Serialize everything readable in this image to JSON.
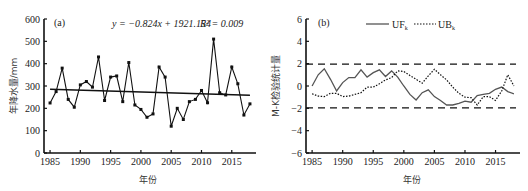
{
  "chart_data": [
    {
      "type": "line",
      "panel_label": "(a)",
      "title": "",
      "xlabel": "年份",
      "ylabel": "年降水量/mm",
      "xlim": [
        1984,
        2019
      ],
      "ylim": [
        0,
        600
      ],
      "xticks": [
        1985,
        1990,
        1995,
        2000,
        2005,
        2010,
        2015
      ],
      "yticks": [
        0,
        100,
        200,
        300,
        400,
        500,
        600
      ],
      "grid": false,
      "annotation": "y = −0.824x + 1921.154",
      "r2_label": "R² = 0.009",
      "x": [
        1985,
        1986,
        1987,
        1988,
        1989,
        1990,
        1991,
        1992,
        1993,
        1994,
        1995,
        1996,
        1997,
        1998,
        1999,
        2000,
        2001,
        2002,
        2003,
        2004,
        2005,
        2006,
        2007,
        2008,
        2009,
        2010,
        2011,
        2012,
        2013,
        2014,
        2015,
        2016,
        2017,
        2018
      ],
      "series": [
        {
          "name": "annual precipitation",
          "style": "solid-with-square-markers",
          "values": [
            224,
            275,
            380,
            240,
            205,
            305,
            320,
            295,
            430,
            235,
            340,
            345,
            230,
            405,
            215,
            195,
            160,
            175,
            385,
            340,
            120,
            200,
            150,
            230,
            240,
            280,
            225,
            510,
            270,
            260,
            385,
            310,
            170,
            220
          ]
        },
        {
          "name": "linear trend",
          "style": "solid",
          "slope": -0.824,
          "intercept": 1921.154,
          "values_at_ends": {
            "1985": 285.5,
            "2018": 258.3
          }
        }
      ]
    },
    {
      "type": "line",
      "panel_label": "(b)",
      "title": "",
      "xlabel": "年份",
      "ylabel": "M-K检验统计量",
      "xlim": [
        1984,
        2019
      ],
      "ylim": [
        -6,
        6
      ],
      "xticks": [
        1985,
        1990,
        1995,
        2000,
        2005,
        2010,
        2015
      ],
      "yticks": [
        -6,
        -4,
        -2,
        0,
        2,
        4,
        6
      ],
      "grid": false,
      "legend": {
        "position": "top-center",
        "entries": [
          "UFk",
          "UBk"
        ]
      },
      "reference_lines": [
        1.96,
        -1.96
      ],
      "x": [
        1985,
        1986,
        1987,
        1988,
        1989,
        1990,
        1991,
        1992,
        1993,
        1994,
        1995,
        1996,
        1997,
        1998,
        1999,
        2000,
        2001,
        2002,
        2003,
        2004,
        2005,
        2006,
        2007,
        2008,
        2009,
        2010,
        2011,
        2012,
        2013,
        2014,
        2015,
        2016,
        2017,
        2018
      ],
      "series": [
        {
          "name": "UFk",
          "style": "solid",
          "values": [
            0.0,
            1.0,
            1.55,
            0.6,
            -0.45,
            0.3,
            0.75,
            0.75,
            1.45,
            0.8,
            1.2,
            1.45,
            0.85,
            1.35,
            0.8,
            0.0,
            -0.75,
            -1.25,
            -0.6,
            -0.35,
            -0.95,
            -1.3,
            -1.7,
            -1.7,
            -1.55,
            -1.35,
            -1.45,
            -0.85,
            -0.75,
            -0.65,
            -0.3,
            -0.1,
            -0.5,
            -0.7
          ]
        },
        {
          "name": "UBk",
          "style": "dotted",
          "values": [
            -0.7,
            -0.9,
            -0.95,
            -0.65,
            -0.65,
            -0.95,
            -0.9,
            -0.75,
            -0.6,
            -0.1,
            -0.1,
            0.2,
            0.55,
            0.75,
            1.35,
            1.3,
            0.95,
            0.6,
            0.25,
            0.9,
            1.5,
            1.0,
            0.55,
            -0.1,
            -0.65,
            -1.0,
            -1.05,
            -1.7,
            -0.95,
            -0.95,
            -1.3,
            -0.45,
            1.0,
            0.0
          ]
        }
      ]
    }
  ],
  "panels": {
    "a": {
      "label": "(a)",
      "equation": "y = −0.824x + 1921.154",
      "r2": "R² = 0.009",
      "xlabel": "年份",
      "ylabel": "年降水量/mm",
      "yticks": [
        "0",
        "100",
        "200",
        "300",
        "400",
        "500",
        "600"
      ],
      "xticks": [
        "1985",
        "1990",
        "1995",
        "2000",
        "2005",
        "2010",
        "2015"
      ]
    },
    "b": {
      "label": "(b)",
      "legend_uf": "UF",
      "legend_uf_sub": "k",
      "legend_ub": "UB",
      "legend_ub_sub": "k",
      "xlabel": "年份",
      "ylabel": "M-K检验统计量",
      "yticks": [
        "−6",
        "−4",
        "−2",
        "0",
        "2",
        "4",
        "6"
      ],
      "xticks": [
        "1985",
        "1990",
        "1995",
        "2000",
        "2005",
        "2010",
        "2015"
      ]
    }
  }
}
